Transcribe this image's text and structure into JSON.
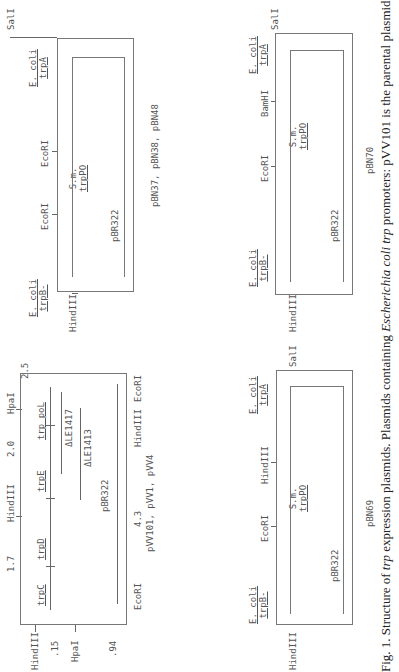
{
  "figure": {
    "caption": {
      "prefix": "Fig. 1. Structure of ",
      "italic1": "trp",
      "mid": " expression plasmids. Plasmids containing ",
      "italic2": "Escherichia coli trp",
      "suffix": " promoters: pVV101 is the parental plasmid containing"
    }
  },
  "panels": {
    "pVV101": {
      "name": "pVV101, pVV1, pVV4",
      "left_sites": [
        "HindIII",
        ".15",
        "HpaI",
        ".94"
      ],
      "top_labels": [
        "1.7",
        "HindIII",
        "2.0",
        "HpaI",
        "2.5"
      ],
      "genes": [
        "trpC",
        "trpD",
        "trpE",
        "trp poL"
      ],
      "deletions": [
        "ΔLE1417",
        "ΔLE1413"
      ],
      "vector": "pBR322",
      "bottom_labels": [
        "EcoRI",
        "4.3",
        "HindIII",
        "EcoRI"
      ]
    },
    "pBN37": {
      "name": "pBN37, pBN38, pBN48",
      "left_site": "HindIII",
      "right_site": "SalI",
      "left_gene_line1": "E. coli",
      "left_gene_line2": "trpB-",
      "right_gene_line1": "E. coli",
      "right_gene_line2": "trpA",
      "sites": [
        "EcoRI",
        "EcoRI"
      ],
      "insert_line1": "S.m.",
      "insert_line2": "trpPO",
      "vector": "pBR322"
    },
    "pBN69": {
      "name": "pBN69",
      "left_site": "HindIII",
      "right_site": "SalI",
      "left_gene_line1": "E. coli",
      "left_gene_line2": "trpB-",
      "right_gene_line1": "E. coli",
      "right_gene_line2": "trpA",
      "sites": [
        "EcoRI",
        "HindIII"
      ],
      "insert_line1": "S.m.",
      "insert_line2": "trpPO",
      "vector": "pBR322"
    },
    "pBN70": {
      "name": "pBN70",
      "left_site": "HindIII",
      "right_site": "SalI",
      "left_gene_line1": "E. coli",
      "left_gene_line2": "trpB-",
      "right_gene_line1": "E. coli",
      "right_gene_line2": "trpA",
      "sites": [
        "EcoRI",
        "BamHI"
      ],
      "insert_line1": "S.m.",
      "insert_line2": "trpPO",
      "vector": "pBR322"
    }
  }
}
